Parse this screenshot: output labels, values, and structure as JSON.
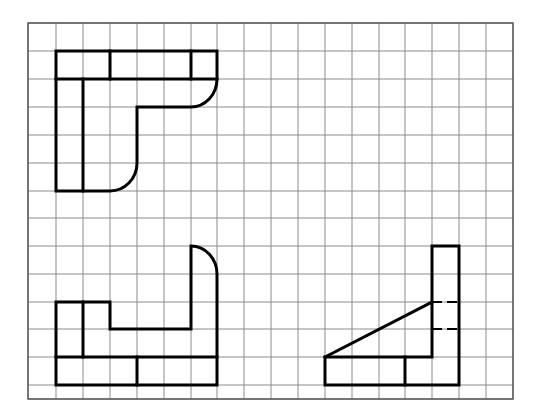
{
  "colors": {
    "background": "#ffffff",
    "grid": "#8a8a8a",
    "frame": "#555555",
    "outline": "#000000"
  },
  "grid": {
    "x_lines": [
      28,
      56,
      83,
      110,
      137,
      164,
      191,
      217,
      244,
      271,
      298,
      325,
      352,
      379,
      405,
      432,
      459,
      486,
      513
    ],
    "y_lines": [
      23,
      51,
      79,
      107,
      135,
      163,
      191,
      218,
      246,
      274,
      302,
      329,
      357,
      385,
      399
    ],
    "frame": {
      "x": 28,
      "y": 23,
      "width": 485,
      "height": 376
    }
  },
  "views": [
    {
      "name": "top-view",
      "paths": [
        "M56 51 H217 V79 A26 28 0 0 1 191 107 H137 V163 A27 28 0 0 1 110 191 H56 Z",
        "M56 79 H217",
        "M110 51 V79",
        "M191 51 V79",
        "M83 79 V191"
      ],
      "dashed": []
    },
    {
      "name": "front-view",
      "paths": [
        "M56 302 H110 V329 H191 V246 A26 28 0 0 1 217 274 V385 H56 Z",
        "M83 302 V357",
        "M56 357 H217",
        "M137 357 V385"
      ],
      "dashed": []
    },
    {
      "name": "side-view",
      "paths": [
        "M432 246 H459 V385 H325 V357 H432 Z",
        "M405 357 V385",
        "M325 357 L432 302"
      ],
      "dashed": [
        "M432 302 H459",
        "M432 329 H459"
      ]
    }
  ]
}
